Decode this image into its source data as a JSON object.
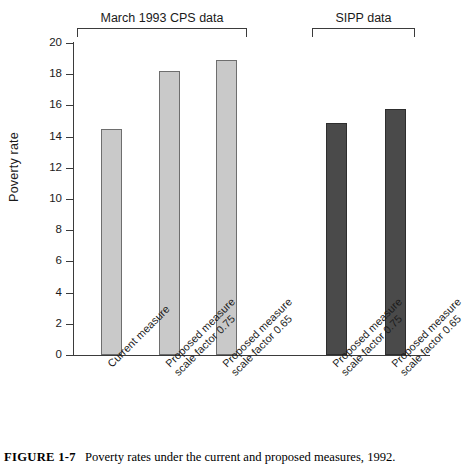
{
  "figure": {
    "number_label": "FIGURE 1-7",
    "caption_text": "Poverty rates under the current and proposed measures, 1992."
  },
  "chart_data": {
    "type": "bar",
    "title": "",
    "xlabel": "",
    "ylabel": "Poverty rate",
    "ylim": [
      0,
      20
    ],
    "yticks": [
      0,
      2,
      4,
      6,
      8,
      10,
      12,
      14,
      16,
      18,
      20
    ],
    "ytick_labels": [
      "0",
      "2",
      "4",
      "6",
      "8",
      "10",
      "12",
      "14",
      "16",
      "18",
      "20"
    ],
    "grid": false,
    "legend": "none",
    "categories": [
      "Current measure",
      "Proposed measure scale factor 0.75",
      "Proposed measure scale factor 0.65",
      "Proposed measure scale factor 0.75",
      "Proposed measure scale factor 0.65"
    ],
    "values": [
      14.5,
      18.2,
      18.9,
      14.9,
      15.75
    ],
    "bars": [
      {
        "label_line1": "Current measure",
        "label_line2": "",
        "value": 14.5,
        "group": "March 1993 CPS data",
        "color": "#c9c9c9"
      },
      {
        "label_line1": "Proposed measure",
        "label_line2": "scale factor 0.75",
        "value": 18.2,
        "group": "March 1993 CPS data",
        "color": "#c9c9c9"
      },
      {
        "label_line1": "Proposed measure",
        "label_line2": "scale factor 0.65",
        "value": 18.9,
        "group": "March 1993 CPS data",
        "color": "#c9c9c9"
      },
      {
        "label_line1": "Proposed measure",
        "label_line2": "scale factor 0.75",
        "value": 14.9,
        "group": "SIPP data",
        "color": "#4a4a4a"
      },
      {
        "label_line1": "Proposed measure",
        "label_line2": "scale factor 0.65",
        "value": 15.75,
        "group": "SIPP data",
        "color": "#4a4a4a"
      }
    ],
    "groups": [
      {
        "label": "March 1993 CPS data",
        "bar_indices": [
          0,
          1,
          2
        ]
      },
      {
        "label": "SIPP data",
        "bar_indices": [
          3,
          4
        ]
      }
    ],
    "colors": {
      "cps_bar_fill": "#c9c9c9",
      "sipp_bar_fill": "#4a4a4a",
      "axis": "#3b3b3b",
      "text": "#1a1a1a"
    }
  }
}
